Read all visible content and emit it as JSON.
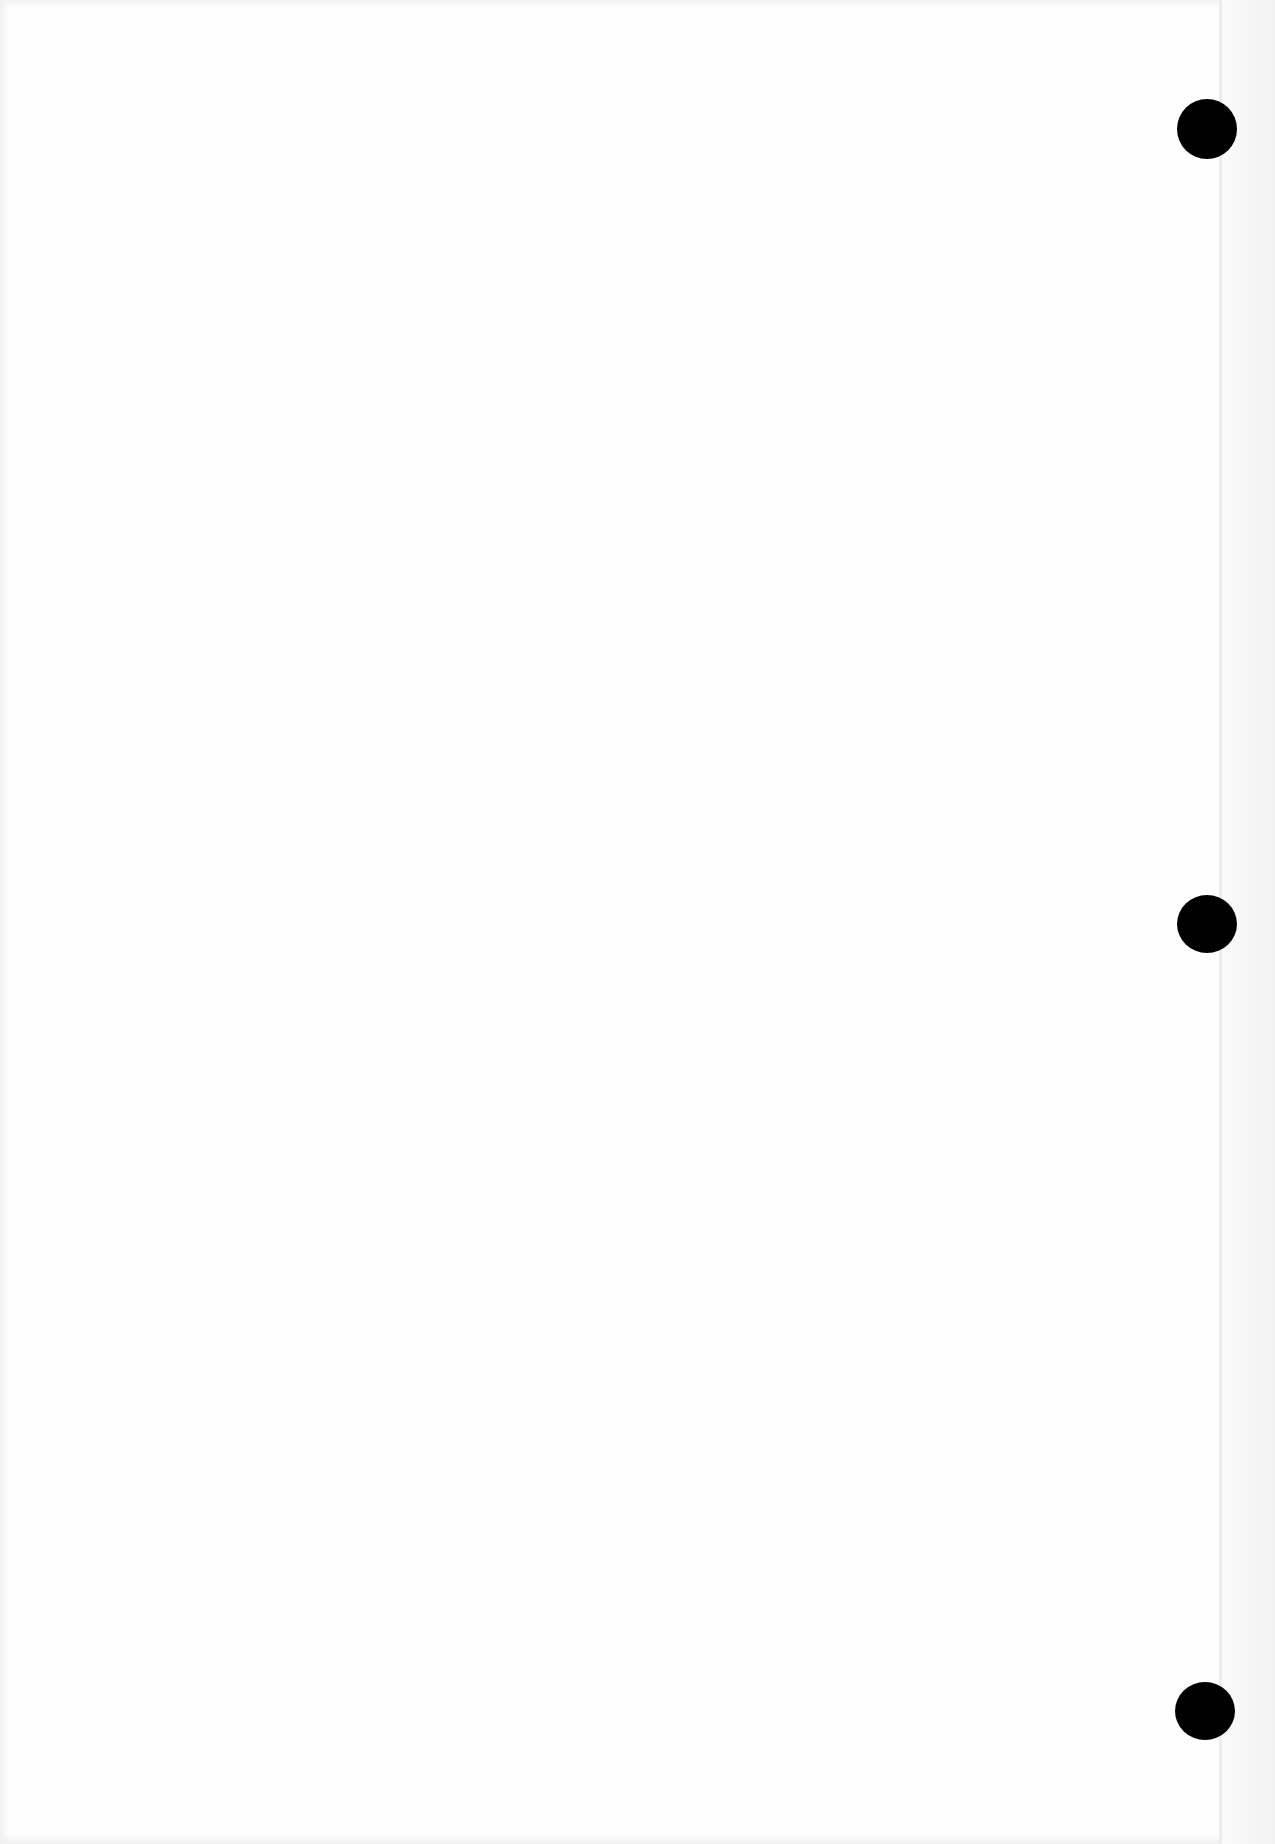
{
  "page": {
    "type": "blank scanned page",
    "background_color": "#fefefe",
    "text_content": ""
  },
  "punch_holes": [
    {
      "cx": 1207,
      "cy": 129,
      "w": 60,
      "h": 60,
      "color": "#000000"
    },
    {
      "cx": 1207,
      "cy": 924,
      "w": 60,
      "h": 58,
      "color": "#000000"
    },
    {
      "cx": 1205,
      "cy": 1711,
      "w": 60,
      "h": 58,
      "color": "#000000"
    }
  ]
}
